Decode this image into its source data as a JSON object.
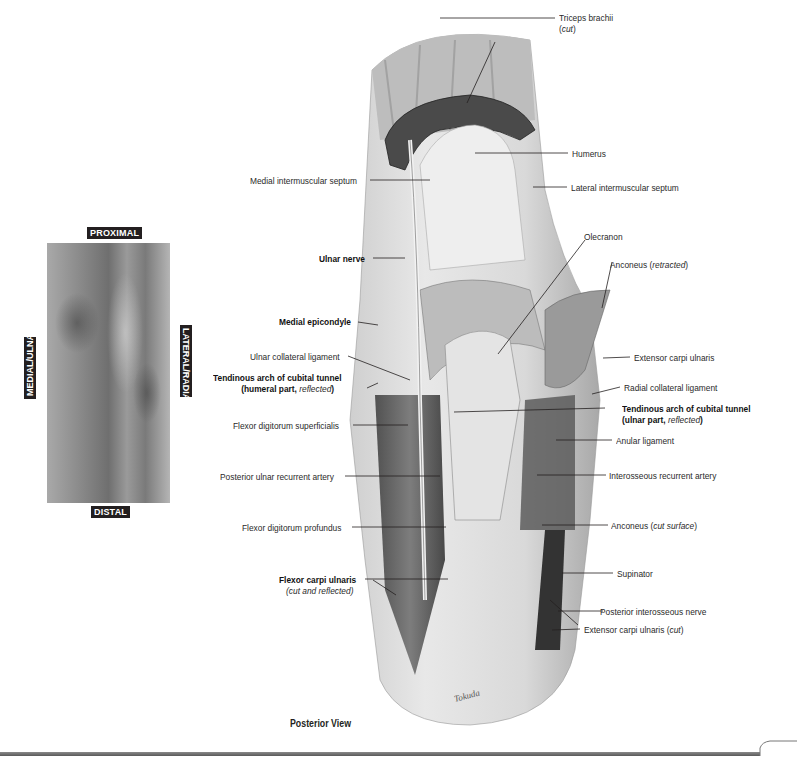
{
  "figure": {
    "view_caption": "Posterior View",
    "signature": "Tokuda",
    "orientation_panel": {
      "top": "PROXIMAL",
      "bottom": "DISTAL",
      "left": "MEDIAL/ULNAR",
      "right": "LATERAL/RADIAL"
    },
    "labels_left": [
      {
        "text": "Medial intermuscular septum",
        "bold": false
      },
      {
        "text": "Ulnar nerve",
        "bold": true
      },
      {
        "text": "Medial epicondyle",
        "bold": true
      },
      {
        "text": "Ulnar collateral ligament",
        "bold": false
      },
      {
        "text": "Tendinous arch of cubital tunnel",
        "bold": true,
        "line2_prefix": "(humeral part, ",
        "line2_italic": "reflected",
        "line2_suffix": ")"
      },
      {
        "text": "Flexor digitorum superficialis",
        "bold": false
      },
      {
        "text": "Posterior ulnar recurrent artery",
        "bold": false
      },
      {
        "text": "Flexor digitorum profundus",
        "bold": false
      },
      {
        "text": "Flexor carpi ulnaris",
        "bold": true,
        "line2_italic": "(cut and reflected)"
      }
    ],
    "labels_right": [
      {
        "text": "Triceps brachii",
        "line2_prefix": "(",
        "line2_italic": "cut",
        "line2_suffix": ")"
      },
      {
        "text": "Humerus"
      },
      {
        "text": "Lateral intermuscular septum"
      },
      {
        "text": "Olecranon"
      },
      {
        "text": "Anconeus (",
        "italic": "retracted",
        "suffix": ")"
      },
      {
        "text": "Extensor carpi ulnaris"
      },
      {
        "text": "Radial collateral ligament"
      },
      {
        "text": "Tendinous arch of cubital tunnel",
        "bold": true,
        "line2_prefix": "(ulnar part, ",
        "line2_italic": "reflected",
        "line2_suffix": ")"
      },
      {
        "text": "Anular ligament"
      },
      {
        "text": "Interosseous recurrent artery"
      },
      {
        "text": "Anconeus (",
        "italic": "cut surface",
        "suffix": ")"
      },
      {
        "text": "Supinator"
      },
      {
        "text": "Posterior interosseous nerve"
      },
      {
        "text": "Extensor carpi ulnaris (",
        "italic": "cut",
        "suffix": ")"
      }
    ]
  }
}
